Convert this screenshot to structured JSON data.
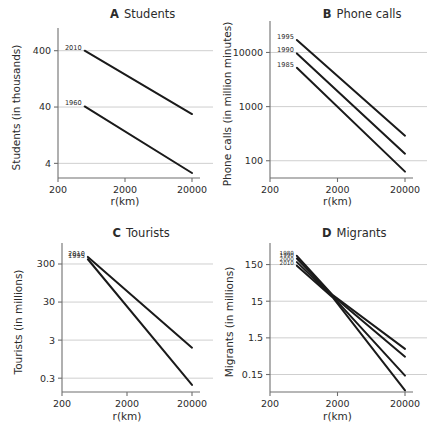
{
  "figure": {
    "background": "#ffffff",
    "line_color": "#1a1a1a",
    "grid_color": "#c9c9c9",
    "axis_color": "#6f6f6f",
    "xlabel": "r(km)",
    "xticks": [
      "200",
      "2000",
      "20000"
    ]
  },
  "chart_data": [
    {
      "type": "line",
      "panel": "A",
      "title_letter": "A",
      "title_word": "Students",
      "xlabel": "r(km)",
      "ylabel": "Students (in thousands)",
      "xscale": "log",
      "yscale": "log",
      "xticks": [
        "200",
        "2000",
        "20000"
      ],
      "xtickvals": [
        200,
        2000,
        20000
      ],
      "yticks": [
        "4",
        "40",
        "400"
      ],
      "ytickvals": [
        4,
        40,
        400
      ],
      "xlim": [
        200,
        20000
      ],
      "ylim": [
        2.2,
        700
      ],
      "grid": "horizontal",
      "series": [
        {
          "name": "2010",
          "label_pos": "top-left",
          "x": [
            500,
            20000
          ],
          "y": [
            400,
            30
          ]
        },
        {
          "name": "1960",
          "label_pos": "top-left",
          "x": [
            500,
            20000
          ],
          "y": [
            41,
            2.7
          ]
        }
      ]
    },
    {
      "type": "line",
      "panel": "B",
      "title_letter": "B",
      "title_word": "Phone calls",
      "xlabel": "r(km)",
      "ylabel": "Phone calls (in million minutes)",
      "xscale": "log",
      "yscale": "log",
      "xticks": [
        "200",
        "2000",
        "20000"
      ],
      "xtickvals": [
        200,
        2000,
        20000
      ],
      "yticks": [
        "100",
        "1000",
        "10000"
      ],
      "ytickvals": [
        100,
        1000,
        10000
      ],
      "xlim": [
        200,
        20000
      ],
      "ylim": [
        48,
        26000
      ],
      "grid": "horizontal",
      "series": [
        {
          "name": "1995",
          "label_pos": "top-left",
          "x": [
            500,
            20000
          ],
          "y": [
            17000,
            290
          ]
        },
        {
          "name": "1990",
          "label_pos": "top-left",
          "x": [
            500,
            20000
          ],
          "y": [
            9600,
            135
          ]
        },
        {
          "name": "1985",
          "label_pos": "top-left",
          "x": [
            500,
            20000
          ],
          "y": [
            5200,
            63
          ]
        }
      ]
    },
    {
      "type": "line",
      "panel": "C",
      "title_letter": "C",
      "title_word": "Tourists",
      "xlabel": "r(km)",
      "ylabel": "Tourists (in millions)",
      "xscale": "log",
      "yscale": "log",
      "xticks": [
        "200",
        "2000",
        "20000"
      ],
      "xtickvals": [
        200,
        2000,
        20000
      ],
      "yticks": [
        "0.3",
        "3",
        "30",
        "300"
      ],
      "ytickvals": [
        0.3,
        3,
        30,
        300
      ],
      "xlim": [
        200,
        20000
      ],
      "ylim": [
        0.13,
        620
      ],
      "grid": "horizontal",
      "series": [
        {
          "name": "2010",
          "label_pos": "top-left",
          "x": [
            500,
            20000
          ],
          "y": [
            460,
            1.9
          ]
        },
        {
          "name": "1995",
          "label_pos": "top-left",
          "x": [
            500,
            20000
          ],
          "y": [
            400,
            0.2
          ]
        }
      ]
    },
    {
      "type": "line",
      "panel": "D",
      "title_letter": "D",
      "title_word": "Migrants",
      "xlabel": "r(km)",
      "ylabel": "Migrants (in millions)",
      "xscale": "log",
      "yscale": "log",
      "xticks": [
        "200",
        "2000",
        "20000"
      ],
      "xtickvals": [
        200,
        2000,
        20000
      ],
      "yticks": [
        "0.15",
        "1.5",
        "15",
        "150"
      ],
      "ytickvals": [
        0.15,
        1.5,
        15,
        150
      ],
      "xlim": [
        200,
        20000
      ],
      "ylim": [
        0.05,
        330
      ],
      "grid": "horizontal",
      "series": [
        {
          "name": "1980",
          "label_pos": "top-left",
          "x": [
            500,
            1700,
            20000
          ],
          "y": [
            260,
            22,
            0.75
          ]
        },
        {
          "name": "1990",
          "label_pos": "top-left",
          "x": [
            500,
            1700,
            20000
          ],
          "y": [
            220,
            21,
            0.46
          ]
        },
        {
          "name": "2000",
          "label_pos": "top-left",
          "x": [
            500,
            1700,
            20000
          ],
          "y": [
            175,
            20,
            0.14
          ]
        },
        {
          "name": "2010",
          "label_pos": "top-left",
          "x": [
            500,
            1700,
            20000
          ],
          "y": [
            140,
            19,
            0.055
          ]
        }
      ]
    }
  ]
}
